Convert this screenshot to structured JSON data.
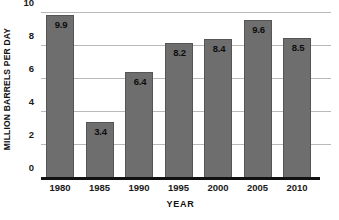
{
  "chart_data": {
    "type": "bar",
    "title": "",
    "subtitle": "",
    "xlabel": "YEAR",
    "ylabel": "MILLION BARRELS PER DAY",
    "categories": [
      "1980",
      "1985",
      "1990",
      "1995",
      "2000",
      "2005",
      "2010"
    ],
    "values": [
      9.9,
      3.4,
      6.4,
      8.2,
      8.4,
      9.6,
      8.5
    ],
    "data_labels": [
      "9.9",
      "3.4",
      "6.4",
      "8.2",
      "8.4",
      "9.6",
      "8.5"
    ],
    "ylim": [
      0,
      10
    ],
    "xlim_categories": 7,
    "y_ticks": [
      10,
      8,
      6,
      4,
      2,
      0
    ],
    "y_tick_labels": [
      "10",
      "8",
      "6",
      "4",
      "2",
      "0"
    ],
    "grid": true,
    "grid_orientation": "horizontal",
    "legend": null,
    "legend_position": "none",
    "annotations": [],
    "colors": {
      "bar_fill": "#6e6e6e",
      "bar_border": "#555555",
      "gridline": "#b9b9b9",
      "axis_line": "#111111",
      "label_text": "#1a1a1a",
      "value_text": "#0d0d0d",
      "background": "#ffffff"
    }
  }
}
